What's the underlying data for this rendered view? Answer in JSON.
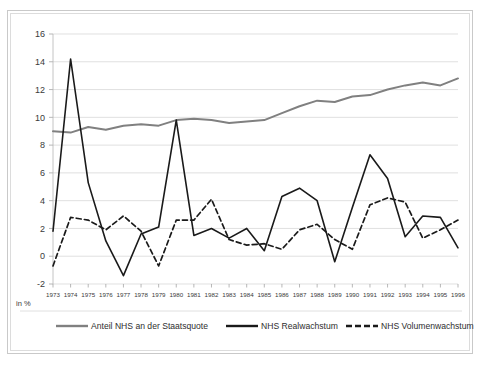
{
  "chart_data": {
    "type": "line",
    "title": "",
    "xlabel": "",
    "ylabel": "in %",
    "unit_label": "in %",
    "ylim": [
      -2,
      16
    ],
    "yticks": [
      -2,
      0,
      2,
      4,
      6,
      8,
      10,
      12,
      14,
      16
    ],
    "grid": true,
    "legend_position": "bottom",
    "categories": [
      "1973",
      "1974",
      "1975",
      "1976",
      "1977",
      "1978",
      "1979",
      "1980",
      "1981",
      "1982",
      "1983",
      "1984",
      "1985",
      "1986",
      "1987",
      "1988",
      "1989",
      "1990",
      "1991",
      "1992",
      "1993",
      "1994",
      "1995",
      "1996"
    ],
    "series": [
      {
        "name": "Anteil NHS an der Staatsquote",
        "style": "solid",
        "color": "#808080",
        "width": 2.0,
        "values": [
          9.0,
          8.9,
          9.3,
          9.1,
          9.4,
          9.5,
          9.4,
          9.8,
          9.9,
          9.8,
          9.6,
          9.7,
          9.8,
          10.3,
          10.8,
          11.2,
          11.1,
          11.5,
          11.6,
          12.0,
          12.3,
          12.5,
          12.3,
          12.8
        ]
      },
      {
        "name": "NHS Realwachstum",
        "style": "solid",
        "color": "#1a1a1a",
        "width": 1.6,
        "values": [
          1.8,
          14.2,
          5.3,
          1.1,
          -1.4,
          1.6,
          2.1,
          9.8,
          1.5,
          2.0,
          1.3,
          2.0,
          0.4,
          4.3,
          4.9,
          4.0,
          -0.4,
          3.5,
          7.3,
          5.6,
          1.4,
          2.9,
          2.8,
          0.6
        ]
      },
      {
        "name": "NHS Volumenwachstum",
        "style": "dashed",
        "color": "#1a1a1a",
        "width": 1.7,
        "values": [
          -0.7,
          2.8,
          2.6,
          1.9,
          2.9,
          1.8,
          -0.7,
          2.6,
          2.6,
          4.1,
          1.2,
          0.8,
          0.9,
          0.5,
          1.9,
          2.3,
          1.2,
          0.5,
          3.7,
          4.2,
          3.9,
          1.3,
          1.9,
          2.6
        ]
      }
    ]
  },
  "axis": {
    "y_ticks": [
      "16",
      "14",
      "12",
      "10",
      "8",
      "6",
      "4",
      "2",
      "0",
      "-2"
    ],
    "x_ticks": [
      "1973",
      "1974",
      "1975",
      "1976",
      "1977",
      "1978",
      "1979",
      "1980",
      "1981",
      "1982",
      "1983",
      "1984",
      "1985",
      "1986",
      "1987",
      "1988",
      "1989",
      "1990",
      "1991",
      "1992",
      "1993",
      "1994",
      "1995",
      "1996"
    ],
    "unit": "in %"
  },
  "legend": {
    "items": [
      {
        "label": "Anteil NHS an der Staatsquote",
        "color": "#808080",
        "style": "solid"
      },
      {
        "label": "NHS Realwachstum",
        "color": "#1a1a1a",
        "style": "solid"
      },
      {
        "label": "NHS Volumenwachstum",
        "color": "#1a1a1a",
        "style": "dashed"
      }
    ]
  }
}
